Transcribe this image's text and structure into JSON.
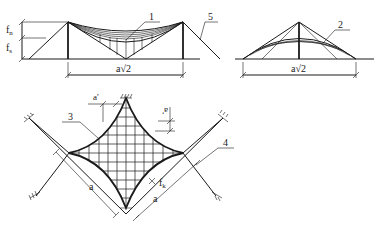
{
  "diagram": {
    "type": "technical-engineering-drawing",
    "stroke_color": "#1a1a1a",
    "background": "#ffffff"
  },
  "labels": {
    "callout_1": "1",
    "callout_2": "2",
    "callout_3": "3",
    "callout_4": "4",
    "callout_5": "5",
    "dim_fn": "f",
    "dim_fn_sub": "n",
    "dim_fs": "f",
    "dim_fs_sub": "s",
    "span_left": "a√2",
    "span_right": "a√2",
    "dim_a_prime_top": "a'",
    "dim_a_prime_right": "a'",
    "dim_a_left": "a",
    "dim_a_right": "a",
    "dim_fk": "f",
    "dim_fk_sub": "k"
  }
}
